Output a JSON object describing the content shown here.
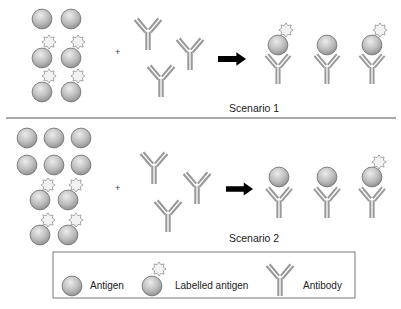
{
  "colors": {
    "antigen_light": "#e2e2e2",
    "antigen_dark": "#8c8c8c",
    "antigen_stroke": "#6e6e6e",
    "star_fill": "#f2f2f2",
    "star_stroke": "#8a8a8a",
    "antibody": "#9a9a9a",
    "arrow": "#000000",
    "divider": "#555555",
    "legend_border": "#7a7a7a"
  },
  "scenarios": [
    {
      "label": "Scenario 1",
      "operator": "+",
      "reactants": {
        "antigens": [
          {
            "x": 42,
            "y": 19,
            "labelled": false
          },
          {
            "x": 71,
            "y": 19,
            "labelled": false
          },
          {
            "x": 42,
            "y": 58,
            "labelled": true
          },
          {
            "x": 71,
            "y": 58,
            "labelled": true
          },
          {
            "x": 42,
            "y": 92,
            "labelled": true
          },
          {
            "x": 71,
            "y": 92,
            "labelled": true
          }
        ],
        "antibodies": [
          {
            "x": 147,
            "y": 18
          },
          {
            "x": 190,
            "y": 38
          },
          {
            "x": 161,
            "y": 66
          }
        ]
      },
      "products": [
        {
          "x": 278,
          "y": 45,
          "labelled": true
        },
        {
          "x": 327,
          "y": 45,
          "labelled": false
        },
        {
          "x": 372,
          "y": 45,
          "labelled": true
        }
      ]
    },
    {
      "label": "Scenario 2",
      "operator": "+",
      "reactants": {
        "antigens": [
          {
            "x": 27,
            "y": 138,
            "labelled": false
          },
          {
            "x": 55,
            "y": 138,
            "labelled": false
          },
          {
            "x": 81,
            "y": 138,
            "labelled": false
          },
          {
            "x": 27,
            "y": 165,
            "labelled": false
          },
          {
            "x": 55,
            "y": 165,
            "labelled": false
          },
          {
            "x": 81,
            "y": 165,
            "labelled": false
          },
          {
            "x": 40,
            "y": 200,
            "labelled": true
          },
          {
            "x": 68,
            "y": 200,
            "labelled": true
          },
          {
            "x": 40,
            "y": 235,
            "labelled": true
          },
          {
            "x": 68,
            "y": 235,
            "labelled": true
          }
        ],
        "antibodies": [
          {
            "x": 154,
            "y": 153
          },
          {
            "x": 197,
            "y": 172
          },
          {
            "x": 167,
            "y": 200
          }
        ]
      },
      "products": [
        {
          "x": 279,
          "y": 176,
          "labelled": false
        },
        {
          "x": 327,
          "y": 176,
          "labelled": false
        },
        {
          "x": 372,
          "y": 176,
          "labelled": true
        }
      ]
    }
  ],
  "legend": {
    "items": [
      {
        "icon": "antigen-icon",
        "label": "Antigen"
      },
      {
        "icon": "labelled-antigen-icon",
        "label": "Labelled antigen"
      },
      {
        "icon": "antibody-icon",
        "label": "Antibody"
      }
    ]
  }
}
